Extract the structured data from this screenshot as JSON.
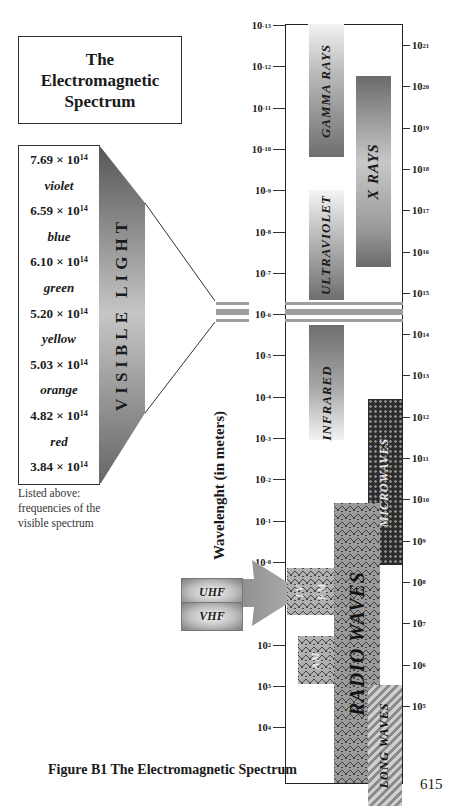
{
  "title": {
    "line1": "The",
    "line2": "Electromagnetic",
    "line3": "Spectrum"
  },
  "visible_light": {
    "band_label": "VISIBLE LIGHT",
    "items": [
      {
        "type": "frequency",
        "mantissa": "7.69 × 10",
        "exp": "14"
      },
      {
        "type": "color",
        "label": "violet"
      },
      {
        "type": "frequency",
        "mantissa": "6.59 × 10",
        "exp": "14"
      },
      {
        "type": "color",
        "label": "blue"
      },
      {
        "type": "frequency",
        "mantissa": "6.10 × 10",
        "exp": "14"
      },
      {
        "type": "color",
        "label": "green"
      },
      {
        "type": "frequency",
        "mantissa": "5.20 × 10",
        "exp": "14"
      },
      {
        "type": "color",
        "label": "yellow"
      },
      {
        "type": "frequency",
        "mantissa": "5.03 × 10",
        "exp": "14"
      },
      {
        "type": "color",
        "label": "orange"
      },
      {
        "type": "frequency",
        "mantissa": "4.82 × 10",
        "exp": "14"
      },
      {
        "type": "color",
        "label": "red"
      },
      {
        "type": "frequency",
        "mantissa": "3.84 × 10",
        "exp": "14"
      }
    ],
    "note": "Listed above: frequencies of the visible spectrum"
  },
  "axes": {
    "left_label": "Wavelenght (in meters)",
    "left_ticks": [
      {
        "base": "10",
        "exp": "-13"
      },
      {
        "base": "10",
        "exp": "-12"
      },
      {
        "base": "10",
        "exp": "-11"
      },
      {
        "base": "10",
        "exp": "-10"
      },
      {
        "base": "10",
        "exp": "-9"
      },
      {
        "base": "10",
        "exp": "-8"
      },
      {
        "base": "10",
        "exp": "-7"
      },
      {
        "base": "10",
        "exp": "-6"
      },
      {
        "base": "10",
        "exp": "-5"
      },
      {
        "base": "10",
        "exp": "-4"
      },
      {
        "base": "10",
        "exp": "-3"
      },
      {
        "base": "10",
        "exp": "-2"
      },
      {
        "base": "10",
        "exp": "-1"
      },
      {
        "base": "10",
        "exp": "-0"
      },
      {
        "base": "10",
        "exp": "1"
      },
      {
        "base": "10",
        "exp": "2"
      },
      {
        "base": "10",
        "exp": "3"
      },
      {
        "base": "10",
        "exp": "4"
      }
    ],
    "right_ticks": [
      {
        "base": "10",
        "exp": "21"
      },
      {
        "base": "10",
        "exp": "20"
      },
      {
        "base": "10",
        "exp": "19"
      },
      {
        "base": "10",
        "exp": "18"
      },
      {
        "base": "10",
        "exp": "17"
      },
      {
        "base": "10",
        "exp": "16"
      },
      {
        "base": "10",
        "exp": "15"
      },
      {
        "base": "10",
        "exp": "14"
      },
      {
        "base": "10",
        "exp": "13"
      },
      {
        "base": "10",
        "exp": "12"
      },
      {
        "base": "10",
        "exp": "11"
      },
      {
        "base": "10",
        "exp": "10"
      },
      {
        "base": "10",
        "exp": "9"
      },
      {
        "base": "10",
        "exp": "8"
      },
      {
        "base": "10",
        "exp": "7"
      },
      {
        "base": "10",
        "exp": "6"
      },
      {
        "base": "10",
        "exp": "5"
      }
    ]
  },
  "bands": {
    "gamma": "GAMMA RAYS",
    "xray": "X RAYS",
    "ultraviolet": "ULTRAVIOLET",
    "infrared": "INFRARED",
    "microwaves": "MICROWAVES",
    "radio": "RADIO WAVES",
    "long": "LONG WAVES",
    "tv": "TV",
    "fm": "FM",
    "am": "AM",
    "uhf": "UHF",
    "vhf": "VHF"
  },
  "caption": "Figure B1  The Electromagnetic Spectrum",
  "page_number": "615"
}
